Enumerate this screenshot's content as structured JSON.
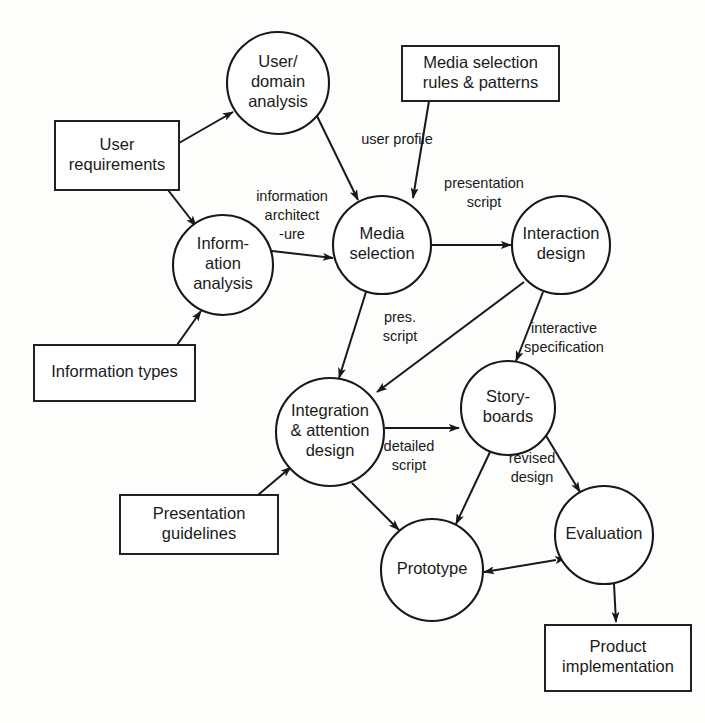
{
  "diagram": {
    "colors": {
      "stroke": "#16181a",
      "fill": "#ffffff",
      "background": "#fdfdfc",
      "text": "#1a1a1a"
    },
    "process_nodes": [
      {
        "id": "user-domain-analysis",
        "label_lines": [
          "User/",
          "domain",
          "analysis"
        ],
        "cx": 278,
        "cy": 83,
        "r": 51
      },
      {
        "id": "information-analysis",
        "label_lines": [
          "Inform-",
          "ation",
          "analysis"
        ],
        "cx": 223,
        "cy": 265,
        "r": 50
      },
      {
        "id": "media-selection",
        "label_lines": [
          "Media",
          "selection"
        ],
        "cx": 382,
        "cy": 245,
        "r": 49
      },
      {
        "id": "interaction-design",
        "label_lines": [
          "Interaction",
          "design"
        ],
        "cx": 561,
        "cy": 245,
        "r": 49
      },
      {
        "id": "integration-attention-design",
        "label_lines": [
          "Integration",
          "& attention",
          "design"
        ],
        "cx": 330,
        "cy": 432,
        "r": 54
      },
      {
        "id": "storyboards",
        "label_lines": [
          "Story-",
          "boards"
        ],
        "cx": 508,
        "cy": 408,
        "r": 47
      },
      {
        "id": "prototype",
        "label_lines": [
          "Prototype"
        ],
        "cx": 432,
        "cy": 570,
        "r": 51
      },
      {
        "id": "evaluation",
        "label_lines": [
          "Evaluation"
        ],
        "cx": 604,
        "cy": 535,
        "r": 49
      }
    ],
    "resource_boxes": [
      {
        "id": "user-requirements",
        "label_lines": [
          "User",
          "requirements"
        ],
        "x": 55,
        "y": 121,
        "w": 124,
        "h": 69
      },
      {
        "id": "media-selection-rules",
        "label_lines": [
          "Media selection",
          "rules & patterns"
        ],
        "x": 402,
        "y": 46,
        "w": 157,
        "h": 55
      },
      {
        "id": "information-types",
        "label_lines": [
          "Information types"
        ],
        "x": 34,
        "y": 345,
        "w": 161,
        "h": 56
      },
      {
        "id": "presentation-guidelines",
        "label_lines": [
          "Presentation",
          "guidelines"
        ],
        "x": 120,
        "y": 495,
        "w": 158,
        "h": 59
      },
      {
        "id": "product-implementation",
        "label_lines": [
          "Product",
          "implementation"
        ],
        "x": 545,
        "y": 625,
        "w": 146,
        "h": 66
      }
    ],
    "edges": [
      {
        "id": "user-requirements-to-user-domain-analysis",
        "from": "user-requirements",
        "to": "user-domain-analysis",
        "label_lines": [],
        "x1": 179,
        "y1": 143,
        "x2": 233,
        "y2": 112,
        "arrow_end": true,
        "arrow_start": false
      },
      {
        "id": "user-requirements-to-information-analysis",
        "from": "user-requirements",
        "to": "information-analysis",
        "label_lines": [],
        "x1": 168,
        "y1": 190,
        "x2": 196,
        "y2": 226,
        "arrow_end": true,
        "arrow_start": false
      },
      {
        "id": "information-types-to-information-analysis",
        "from": "information-types",
        "to": "information-analysis",
        "label_lines": [],
        "x1": 177,
        "y1": 345,
        "x2": 201,
        "y2": 311,
        "arrow_end": true,
        "arrow_start": false
      },
      {
        "id": "user-domain-analysis-to-media-selection",
        "from": "user-domain-analysis",
        "to": "media-selection",
        "label_lines": [
          "user profile"
        ],
        "label_x": 397,
        "label_y": 140,
        "x1": 317,
        "y1": 116,
        "x2": 358,
        "y2": 200,
        "arrow_end": true,
        "arrow_start": false
      },
      {
        "id": "information-analysis-to-media-selection",
        "from": "information-analysis",
        "to": "media-selection",
        "label_lines": [
          "information",
          "architect",
          "-ure"
        ],
        "label_x": 292,
        "label_y": 216,
        "x1": 272,
        "y1": 251,
        "x2": 333,
        "y2": 258,
        "arrow_end": true,
        "arrow_start": false
      },
      {
        "id": "media-selection-rules-to-media-selection",
        "from": "media-selection-rules",
        "to": "media-selection",
        "label_lines": [],
        "x1": 429,
        "y1": 101,
        "x2": 413,
        "y2": 198,
        "arrow_end": true,
        "arrow_start": false
      },
      {
        "id": "media-selection-to-interaction-design",
        "from": "media-selection",
        "to": "interaction-design",
        "label_lines": [
          "presentation",
          "script"
        ],
        "label_x": 484,
        "label_y": 193,
        "x1": 432,
        "y1": 245,
        "x2": 511,
        "y2": 245,
        "arrow_end": true,
        "arrow_start": false
      },
      {
        "id": "media-selection-to-integration-attention-design",
        "from": "media-selection",
        "to": "integration-attention-design",
        "label_lines": [
          "pres.",
          "script"
        ],
        "label_x": 400,
        "label_y": 327,
        "x1": 366,
        "y1": 292,
        "x2": 339,
        "y2": 378,
        "arrow_end": true,
        "arrow_start": false
      },
      {
        "id": "interaction-design-to-integration-attention-design",
        "from": "interaction-design",
        "to": "integration-attention-design",
        "label_lines": [],
        "x1": 524,
        "y1": 282,
        "x2": 377,
        "y2": 392,
        "arrow_end": true,
        "arrow_start": false
      },
      {
        "id": "interaction-design-to-storyboards",
        "from": "interaction-design",
        "to": "storyboards",
        "label_lines": [
          "interactive",
          "specification"
        ],
        "label_x": 564,
        "label_y": 338,
        "x1": 543,
        "y1": 292,
        "x2": 516,
        "y2": 361,
        "arrow_end": true,
        "arrow_start": false
      },
      {
        "id": "presentation-guidelines-to-integration-attention-design",
        "from": "presentation-guidelines",
        "to": "integration-attention-design",
        "label_lines": [],
        "x1": 258,
        "y1": 495,
        "x2": 291,
        "y2": 467,
        "arrow_end": true,
        "arrow_start": false
      },
      {
        "id": "integration-attention-design-to-storyboards",
        "from": "integration-attention-design",
        "to": "storyboards",
        "label_lines": [
          "detailed",
          "script"
        ],
        "label_x": 409,
        "label_y": 456,
        "x1": 385,
        "y1": 428,
        "x2": 459,
        "y2": 428,
        "arrow_end": true,
        "arrow_start": false
      },
      {
        "id": "integration-attention-design-to-prototype",
        "from": "integration-attention-design",
        "to": "prototype",
        "label_lines": [],
        "x1": 352,
        "y1": 483,
        "x2": 399,
        "y2": 530,
        "arrow_end": true,
        "arrow_start": false
      },
      {
        "id": "storyboards-to-prototype",
        "from": "storyboards",
        "to": "prototype",
        "label_lines": [],
        "x1": 490,
        "y1": 452,
        "x2": 456,
        "y2": 524,
        "arrow_end": true,
        "arrow_start": false
      },
      {
        "id": "storyboards-evaluation",
        "from": "storyboards",
        "to": "evaluation",
        "label_lines": [
          "revised",
          "design"
        ],
        "label_x": 532,
        "label_y": 468,
        "x1": 545,
        "y1": 434,
        "x2": 580,
        "y2": 492,
        "arrow_end": true,
        "arrow_start": true
      },
      {
        "id": "evaluation-prototype",
        "from": "evaluation",
        "to": "prototype",
        "label_lines": [],
        "x1": 556,
        "y1": 560,
        "x2": 484,
        "y2": 572,
        "arrow_end": true,
        "arrow_start": true
      },
      {
        "id": "evaluation-to-product-implementation",
        "from": "evaluation",
        "to": "product-implementation",
        "label_lines": [],
        "x1": 614,
        "y1": 584,
        "x2": 616,
        "y2": 622,
        "arrow_end": true,
        "arrow_start": false
      }
    ]
  }
}
